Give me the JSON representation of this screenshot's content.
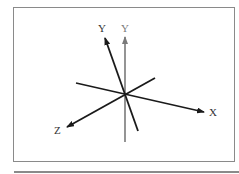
{
  "diagram": {
    "type": "3d-axes-rotation",
    "labels": {
      "y_rotated": "Y",
      "y_original": "Y",
      "x": "X",
      "z": "Z"
    },
    "colors": {
      "rotated_axis": "#1a1a1a",
      "original_axis": "#7a7a7a",
      "frame": "#8a8a8a"
    }
  }
}
